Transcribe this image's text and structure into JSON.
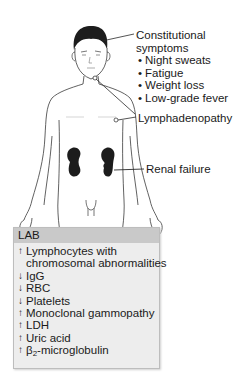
{
  "diagram": {
    "symptoms": {
      "heading_line1": "Constitutional",
      "heading_line2": "symptoms",
      "items": [
        "Night sweats",
        "Fatigue",
        "Weight loss",
        "Low-grade fever"
      ]
    },
    "lymphadenopathy_label": "Lymphadenopathy",
    "renal_label": "Renal failure",
    "lab": {
      "header": "LAB",
      "items": [
        {
          "dir": "up",
          "arrow": "↑",
          "text": "Lymphocytes with",
          "cont": "chromosomal abnormalities"
        },
        {
          "dir": "down",
          "arrow": "↓",
          "text": "IgG"
        },
        {
          "dir": "down",
          "arrow": "↓",
          "text": "RBC"
        },
        {
          "dir": "down",
          "arrow": "↓",
          "text": "Platelets"
        },
        {
          "dir": "up",
          "arrow": "↑",
          "text": "Monoclonal gammopathy"
        },
        {
          "dir": "up",
          "arrow": "↑",
          "text": "LDH"
        },
        {
          "dir": "up",
          "arrow": "↑",
          "text": "Uric acid"
        },
        {
          "dir": "up",
          "arrow": "↑",
          "text_prefix": "β",
          "sub": "2",
          "text": "-microglobulin"
        }
      ]
    },
    "colors": {
      "kidney": "#1c1c1c",
      "outline": "#3a3a3a",
      "lab_bg": "#ededed",
      "lab_header_bg": "#c9c9c9"
    }
  }
}
